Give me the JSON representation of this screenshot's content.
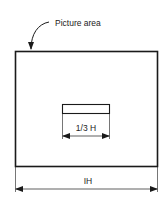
{
  "diagram": {
    "callout_label": "Picture area",
    "inner_dimension_label": "1/3 H",
    "outer_dimension_label": "IH",
    "colors": {
      "stroke": "#1a1a1a",
      "text": "#222222",
      "background": "#ffffff"
    }
  }
}
